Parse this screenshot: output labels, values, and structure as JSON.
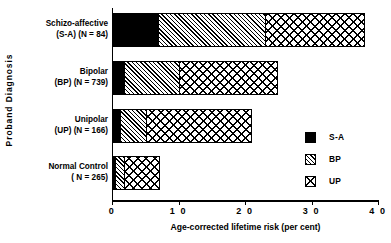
{
  "chart_data": {
    "type": "bar",
    "orientation": "horizontal",
    "stacked": true,
    "title": "",
    "xlabel": "Age-corrected lifetime risk (per cent)",
    "ylabel": "Proband  Diagnosis",
    "xlim": [
      0,
      40
    ],
    "xticks": [
      0,
      10,
      20,
      30,
      40
    ],
    "xtick_labels": [
      "0",
      "1 0",
      "2 0",
      "3 0",
      "4 0"
    ],
    "grid": false,
    "legend_position": "right",
    "categories": [
      "Schizo-affective (S-A) (N = 84)",
      "Bipolar (BP) (N = 739)",
      "Unipolar (UP) (N = 166)",
      "Normal Control ( N = 265)"
    ],
    "category_labels": [
      {
        "line1": "Schizo-affective",
        "line2": "(S-A) (N = 84)"
      },
      {
        "line1": "Bipolar",
        "line2": "(BP) (N = 739)"
      },
      {
        "line1": "Unipolar",
        "line2": "(UP) (N = 166)"
      },
      {
        "line1": "Normal Control",
        "line2": "( N = 265)"
      }
    ],
    "series": [
      {
        "name": "S-A",
        "key": "sa",
        "pattern": "solid-black",
        "color": "#000000",
        "values": [
          6.8,
          1.7,
          1.0,
          0.3
        ]
      },
      {
        "name": "BP",
        "key": "bp",
        "pattern": "diagonal-hatch",
        "color": "#000000",
        "values": [
          16.2,
          8.3,
          4.1,
          1.4
        ]
      },
      {
        "name": "UP",
        "key": "up",
        "pattern": "cross-hatch",
        "color": "#000000",
        "values": [
          15.0,
          15.0,
          15.9,
          5.5
        ]
      }
    ],
    "totals": [
      38.0,
      25.0,
      21.0,
      7.2
    ],
    "legend": [
      {
        "label": "S-A",
        "pattern": "solid-black"
      },
      {
        "label": "BP",
        "pattern": "diagonal-hatch"
      },
      {
        "label": "UP",
        "pattern": "cross-hatch"
      }
    ]
  }
}
